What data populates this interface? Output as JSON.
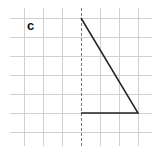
{
  "figure": {
    "label": "c",
    "grid": {
      "vertical_lines_x": [
        24,
        43,
        62,
        100,
        119,
        138
      ],
      "horizontal_lines_y": [
        18,
        37,
        56,
        75,
        94,
        113,
        132
      ],
      "x_range": [
        10,
        152
      ],
      "y_range": [
        8,
        146
      ],
      "color": "#d0d0d0"
    },
    "symmetry_line": {
      "x": 81,
      "y1": 8,
      "y2": 146,
      "style": "dashed",
      "color": "#777777"
    },
    "shape": {
      "type": "triangle-half",
      "points": [
        [
          81,
          18
        ],
        [
          138,
          113
        ],
        [
          81,
          113
        ]
      ],
      "stroke": "#222222"
    }
  }
}
